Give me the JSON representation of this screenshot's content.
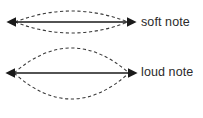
{
  "figure": {
    "background_color": "#ffffff",
    "line_color": "#1a1a1a",
    "envelope_color": "#3a3a3a",
    "text_color": "#2b2b2b"
  },
  "labels": {
    "soft_note": "soft note",
    "loud_note": "loud note"
  },
  "chart_data": {
    "type": "line",
    "xlabel": "",
    "ylabel": "",
    "grid": false,
    "legend_position": "right",
    "annotations": [
      "soft note",
      "loud note"
    ],
    "series": [
      {
        "name": "soft note",
        "style": "solid-double-arrow",
        "description": "string at rest axis for small amplitude vibration",
        "x": [
          14,
          129
        ],
        "y": [
          22,
          22
        ],
        "amplitude": 11,
        "envelope_style": "dashed",
        "envelope_top_peak_y": 11,
        "envelope_bottom_peak_y": 33
      },
      {
        "name": "loud note",
        "style": "solid-double-arrow",
        "description": "string at rest axis for large amplitude vibration",
        "x": [
          13,
          130
        ],
        "y": [
          73,
          73
        ],
        "amplitude": 25,
        "envelope_style": "dashed",
        "envelope_top_peak_y": 48,
        "envelope_bottom_peak_y": 99
      }
    ]
  }
}
